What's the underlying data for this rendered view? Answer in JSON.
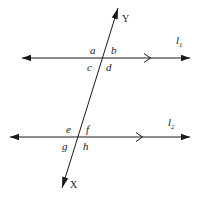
{
  "figure": {
    "type": "geometry-diagram",
    "background_color": "#ffffff",
    "ink_color": "#1a1a1a",
    "width": 200,
    "height": 198
  },
  "lines": [
    {
      "id": "line-1",
      "name": "l1",
      "label_letter": "l",
      "label_subscript": "1",
      "orientation": "horizontal",
      "y": 58,
      "x_start": 22,
      "x_end": 190,
      "arrow_start": true,
      "arrow_end": true,
      "direction_marker": ">",
      "direction_marker_x": 148,
      "label_x": 176,
      "label_y": 44
    },
    {
      "id": "line-2",
      "name": "l2",
      "label_letter": "l",
      "label_subscript": "2",
      "orientation": "horizontal",
      "y": 137,
      "x_start": 10,
      "x_end": 190,
      "arrow_start": true,
      "arrow_end": true,
      "direction_marker": ">",
      "direction_marker_x": 140,
      "label_x": 168,
      "label_y": 126
    }
  ],
  "transversal": {
    "id": "transversal-xy",
    "name": "XY",
    "endpoint_top_label": "Y",
    "endpoint_bottom_label": "X",
    "x_top": 118,
    "y_top": 8,
    "x_bottom": 62,
    "y_bottom": 188,
    "arrow_top": true,
    "arrow_bottom": true,
    "label_y_x": 122,
    "label_y_y": 22,
    "label_x_x": 70,
    "label_x_y": 188
  },
  "intersections": [
    {
      "id": "upper-intersection",
      "with_line": "l1",
      "x": 100,
      "y": 58
    },
    {
      "id": "lower-intersection",
      "with_line": "l2",
      "x": 78,
      "y": 137
    }
  ],
  "angles": [
    {
      "id": "angle-a",
      "label": "a",
      "x": 90,
      "y": 54,
      "position": "upper-intersection-top-left"
    },
    {
      "id": "angle-b",
      "label": "b",
      "x": 111,
      "y": 54,
      "position": "upper-intersection-top-right"
    },
    {
      "id": "angle-c",
      "label": "c",
      "x": 87,
      "y": 71,
      "position": "upper-intersection-bottom-left"
    },
    {
      "id": "angle-d",
      "label": "d",
      "x": 106,
      "y": 71,
      "position": "upper-intersection-bottom-right"
    },
    {
      "id": "angle-e",
      "label": "e",
      "x": 66,
      "y": 133,
      "position": "lower-intersection-top-left"
    },
    {
      "id": "angle-f",
      "label": "f",
      "x": 86,
      "y": 133,
      "position": "lower-intersection-top-right"
    },
    {
      "id": "angle-g",
      "label": "g",
      "x": 62,
      "y": 150,
      "position": "lower-intersection-bottom-left"
    },
    {
      "id": "angle-h",
      "label": "h",
      "x": 83,
      "y": 150,
      "position": "lower-intersection-bottom-right"
    }
  ]
}
